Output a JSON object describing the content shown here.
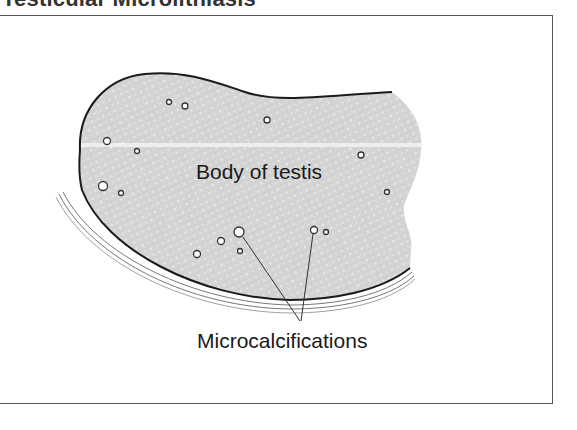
{
  "figure": {
    "title": "Testicular Microlithiasis",
    "labels": {
      "body": "Body of testis",
      "calcifications": "Microcalcifications"
    },
    "colors": {
      "tissue_fill": "#d4d4d4",
      "tissue_dots": "#f2f2f2",
      "outline": "#1a1a1a",
      "tunica_lines": "#777777",
      "frame": "#555555",
      "calcification_stroke": "#333333",
      "calcification_fill": "#ffffff"
    },
    "calcifications": [
      {
        "x": 169,
        "y": 102,
        "r": 2.5
      },
      {
        "x": 185,
        "y": 106,
        "r": 3
      },
      {
        "x": 267,
        "y": 120,
        "r": 3
      },
      {
        "x": 107,
        "y": 141,
        "r": 3.5
      },
      {
        "x": 137,
        "y": 151,
        "r": 2.5
      },
      {
        "x": 361,
        "y": 155,
        "r": 3
      },
      {
        "x": 103,
        "y": 186,
        "r": 4.5
      },
      {
        "x": 121,
        "y": 193,
        "r": 2.5
      },
      {
        "x": 387,
        "y": 192,
        "r": 2.5
      },
      {
        "x": 239,
        "y": 232,
        "r": 5
      },
      {
        "x": 221,
        "y": 241,
        "r": 3.5
      },
      {
        "x": 197,
        "y": 254,
        "r": 3.5
      },
      {
        "x": 240,
        "y": 251,
        "r": 2.5
      },
      {
        "x": 314,
        "y": 230,
        "r": 3.5
      },
      {
        "x": 326,
        "y": 232,
        "r": 2.5
      }
    ],
    "leader_lines": [
      {
        "x1": 243,
        "y1": 237,
        "x2": 300,
        "y2": 321
      },
      {
        "x1": 313,
        "y1": 234,
        "x2": 301,
        "y2": 321
      }
    ]
  }
}
